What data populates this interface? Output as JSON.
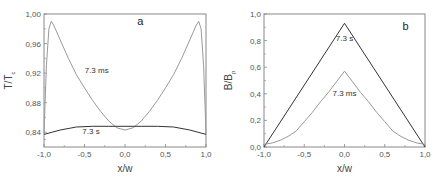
{
  "chart_data": [
    {
      "type": "line",
      "panel_label": "a",
      "xlabel": "x/w",
      "ylabel": "T/T_c",
      "xlim": [
        -1.0,
        1.0
      ],
      "ylim": [
        0.82,
        1.0
      ],
      "xticks": [
        "-1,0",
        "-0,5",
        "0,0",
        "0,5",
        "1,0"
      ],
      "yticks": [
        "0,84",
        "0,88",
        "0,92",
        "0,96",
        "1,00"
      ],
      "grid": false,
      "series": [
        {
          "name": "7.3 ms",
          "color": "#9a9a9a",
          "x": [
            -1.0,
            -0.97,
            -0.94,
            -0.91,
            -0.88,
            -0.8,
            -0.7,
            -0.6,
            -0.5,
            -0.4,
            -0.3,
            -0.2,
            -0.1,
            0.0,
            0.1,
            0.2,
            0.3,
            0.4,
            0.5,
            0.6,
            0.7,
            0.8,
            0.88,
            0.91,
            0.94,
            0.97,
            1.0
          ],
          "y": [
            0.838,
            0.93,
            0.98,
            0.99,
            0.985,
            0.965,
            0.94,
            0.918,
            0.9,
            0.883,
            0.868,
            0.855,
            0.846,
            0.843,
            0.846,
            0.855,
            0.868,
            0.883,
            0.9,
            0.918,
            0.94,
            0.965,
            0.985,
            0.99,
            0.98,
            0.93,
            0.838
          ]
        },
        {
          "name": "7.3 s",
          "color": "#333333",
          "x": [
            -1.0,
            -0.8,
            -0.6,
            -0.4,
            -0.2,
            0.0,
            0.2,
            0.4,
            0.6,
            0.8,
            1.0
          ],
          "y": [
            0.837,
            0.843,
            0.847,
            0.848,
            0.848,
            0.848,
            0.848,
            0.848,
            0.847,
            0.843,
            0.837
          ]
        }
      ],
      "annotations": [
        {
          "text": "7.3 ms",
          "x": -0.35,
          "y": 0.92
        },
        {
          "text": "7.3 s",
          "x": -0.42,
          "y": 0.838
        },
        {
          "text": "a",
          "x": 0.15,
          "y": 0.985
        }
      ]
    },
    {
      "type": "line",
      "panel_label": "b",
      "xlabel": "x/w",
      "ylabel": "B/B_p",
      "xlim": [
        -1.0,
        1.0
      ],
      "ylim": [
        0.0,
        1.0
      ],
      "xticks": [
        "-1,0",
        "-0,5",
        "0,0",
        "0,5",
        "1,0"
      ],
      "yticks": [
        "0,0",
        "0,2",
        "0,4",
        "0,6",
        "0,8",
        "1,0"
      ],
      "grid": false,
      "series": [
        {
          "name": "7.3 s",
          "color": "#333333",
          "x": [
            -1.0,
            0.0,
            1.0
          ],
          "y": [
            0.0,
            0.93,
            0.0
          ]
        },
        {
          "name": "7.3 ms",
          "color": "#9a9a9a",
          "x": [
            -1.0,
            -0.9,
            -0.8,
            -0.7,
            -0.6,
            -0.5,
            -0.4,
            -0.3,
            -0.2,
            -0.1,
            0.0,
            0.1,
            0.2,
            0.3,
            0.4,
            0.5,
            0.6,
            0.7,
            0.8,
            0.9,
            1.0
          ],
          "y": [
            0.02,
            0.03,
            0.05,
            0.08,
            0.12,
            0.19,
            0.26,
            0.34,
            0.41,
            0.49,
            0.57,
            0.49,
            0.41,
            0.34,
            0.26,
            0.19,
            0.12,
            0.08,
            0.05,
            0.03,
            0.02
          ]
        }
      ],
      "annotations": [
        {
          "text": "7.3 s",
          "x": 0.0,
          "y": 0.8
        },
        {
          "text": "7.3 ms",
          "x": 0.0,
          "y": 0.38
        },
        {
          "text": "b",
          "x": 0.72,
          "y": 0.88
        }
      ]
    }
  ]
}
